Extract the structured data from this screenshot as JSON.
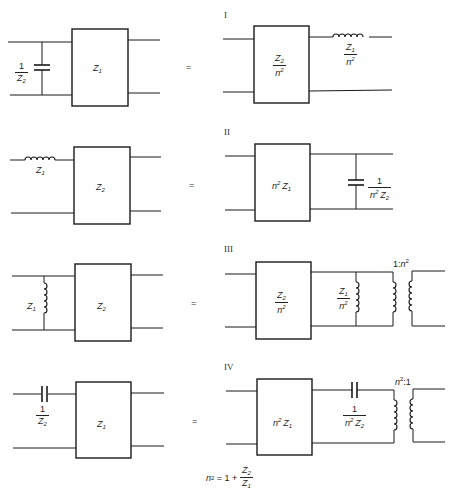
{
  "diagram": {
    "equals_sign": "=",
    "rows": [
      {
        "roman": "I",
        "left": {
          "shunt_cap": {
            "num": "1",
            "den": "Z",
            "den_sub": "2"
          },
          "box": {
            "text": "Z",
            "sub": "1"
          }
        },
        "right": {
          "box": {
            "num": "Z",
            "num_sub": "2",
            "den": "n",
            "den_sup": "2"
          },
          "series_inductor": {
            "num": "Z",
            "num_sub": "1",
            "den": "n",
            "den_sup": "2"
          }
        }
      },
      {
        "roman": "II",
        "left": {
          "series_inductor": {
            "text": "Z",
            "sub": "1"
          },
          "box": {
            "text": "Z",
            "sub": "2"
          }
        },
        "right": {
          "box": {
            "pre": "n",
            "pre_sup": "2",
            "text": "Z",
            "sub": "1"
          },
          "shunt_cap": {
            "num": "1",
            "den_pre": "n",
            "den_sup": "2",
            "den": "Z",
            "den_sub": "2"
          }
        }
      },
      {
        "roman": "III",
        "left": {
          "shunt_inductor": {
            "text": "Z",
            "sub": "1"
          },
          "box": {
            "text": "Z",
            "sub": "2"
          }
        },
        "right": {
          "box": {
            "num": "Z",
            "num_sub": "2",
            "den": "n",
            "den_sup": "2"
          },
          "shunt_inductor": {
            "num": "Z",
            "num_sub": "1",
            "den": "n",
            "den_sup": "2"
          },
          "transformer": {
            "ratio_pre": "1:",
            "ratio_n": "n",
            "ratio_sup": "2"
          }
        }
      },
      {
        "roman": "IV",
        "left": {
          "series_cap": {
            "num": "1",
            "den": "Z",
            "den_sub": "2"
          },
          "box": {
            "text": "Z",
            "sub": "1"
          }
        },
        "right": {
          "box": {
            "pre": "n",
            "pre_sup": "2",
            "text": "Z",
            "sub": "1"
          },
          "series_cap": {
            "num": "1",
            "den_pre": "n",
            "den_sup": "2",
            "den": "Z",
            "den_sub": "2"
          },
          "transformer": {
            "ratio_n": "n",
            "ratio_sup": "2",
            "ratio_post": ":1"
          }
        }
      }
    ],
    "formula": {
      "lhs": "n",
      "lhs_sup": "2",
      "eq": " = 1 + ",
      "num": "Z",
      "num_sub": "2",
      "den": "Z",
      "den_sub": "1"
    }
  }
}
